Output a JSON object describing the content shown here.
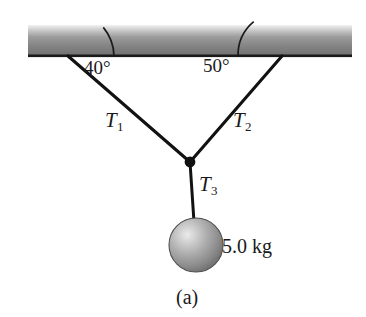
{
  "figure": {
    "caption": "(a)",
    "background_color": "#ffffff",
    "ink_color": "#1a1a1a"
  },
  "labels": {
    "angle_left": "40°",
    "angle_right": "50°",
    "tension1_symbol": "T",
    "tension1_sub": "1",
    "tension2_symbol": "T",
    "tension2_sub": "2",
    "tension3_symbol": "T",
    "tension3_sub": "3",
    "mass": "5.0 kg"
  },
  "ceiling": {
    "name": "ceiling-bar",
    "x": 28,
    "y": 25,
    "width": 324,
    "height": 31,
    "top_color": "#e8e8e8",
    "mid_color": "#8a8a8a",
    "bottom_color": "#6f6f6f",
    "edge_color": "#1a1a1a"
  },
  "ropes": [
    {
      "name": "rope-t1",
      "label": "T1",
      "angle_deg": 40,
      "from_x": 68,
      "from_y": 56,
      "to_x": 190,
      "to_y": 162
    },
    {
      "name": "rope-t2",
      "label": "T2",
      "angle_deg": 50,
      "from_x": 282,
      "from_y": 56,
      "to_x": 190,
      "to_y": 162
    },
    {
      "name": "rope-t3",
      "label": "T3",
      "angle_deg": 90,
      "from_x": 190,
      "from_y": 162,
      "to_x": 193,
      "to_y": 221
    }
  ],
  "knot": {
    "name": "knot-junction",
    "cx": 190,
    "cy": 162,
    "r": 5.2,
    "color": "#111111"
  },
  "sphere": {
    "name": "hanging-mass-sphere",
    "cx": 196,
    "cy": 245,
    "r": 27,
    "highlight_color": "#e6e6e6",
    "mid_color": "#a8a8a8",
    "edge_color": "#6a6a6a",
    "outline_color": "#4a4a4a",
    "mass_text": "5.0 kg"
  },
  "angle_arcs": [
    {
      "name": "angle-arc-40",
      "vertex_x": 68,
      "vertex_y": 56,
      "radius": 46,
      "value": "40°"
    },
    {
      "name": "angle-arc-50",
      "vertex_x": 282,
      "vertex_y": 56,
      "radius": 44,
      "value": "50°"
    }
  ]
}
